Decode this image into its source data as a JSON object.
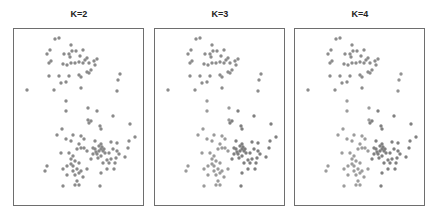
{
  "chart_data": [
    {
      "type": "scatter",
      "title": "K=2",
      "xlabel": "",
      "ylabel": "",
      "grid": false,
      "legend": null,
      "clusters": 2,
      "point_color": "#8a8a8a",
      "cluster_colors": [
        "#8a8a8a",
        "#8a8a8a"
      ]
    },
    {
      "type": "scatter",
      "title": "K=3",
      "xlabel": "",
      "ylabel": "",
      "grid": false,
      "legend": null,
      "clusters": 3,
      "cluster_colors": [
        "#8c8c8c",
        "#9a9a9a",
        "#7f7f7f"
      ]
    },
    {
      "type": "scatter",
      "title": "K=4",
      "xlabel": "",
      "ylabel": "",
      "grid": false,
      "legend": null,
      "clusters": 4,
      "cluster_colors": [
        "#8c8c8c",
        "#9c9c9c",
        "#808080",
        "#939393"
      ]
    }
  ],
  "points": [
    [
      54,
      38
    ],
    [
      58,
      37
    ],
    [
      70,
      44
    ],
    [
      46,
      53
    ],
    [
      49,
      49
    ],
    [
      63,
      53
    ],
    [
      68,
      53
    ],
    [
      71,
      50
    ],
    [
      69,
      56
    ],
    [
      75,
      50
    ],
    [
      82,
      49
    ],
    [
      79,
      55
    ],
    [
      86,
      57
    ],
    [
      84,
      59
    ],
    [
      88,
      62
    ],
    [
      93,
      60
    ],
    [
      96,
      58
    ],
    [
      50,
      60
    ],
    [
      48,
      62
    ],
    [
      62,
      63
    ],
    [
      66,
      64
    ],
    [
      70,
      62
    ],
    [
      74,
      62
    ],
    [
      78,
      61
    ],
    [
      82,
      62
    ],
    [
      94,
      64
    ],
    [
      88,
      72
    ],
    [
      90,
      69
    ],
    [
      86,
      71
    ],
    [
      48,
      75
    ],
    [
      58,
      75
    ],
    [
      68,
      75
    ],
    [
      78,
      74
    ],
    [
      80,
      76
    ],
    [
      60,
      82
    ],
    [
      65,
      81
    ],
    [
      26,
      89
    ],
    [
      53,
      89
    ],
    [
      80,
      87
    ],
    [
      119,
      73
    ],
    [
      117,
      79
    ],
    [
      116,
      90
    ],
    [
      65,
      100
    ],
    [
      65,
      110
    ],
    [
      87,
      107
    ],
    [
      96,
      110
    ],
    [
      112,
      115
    ],
    [
      87,
      119
    ],
    [
      90,
      120
    ],
    [
      88,
      122
    ],
    [
      99,
      125
    ],
    [
      100,
      128
    ],
    [
      129,
      123
    ],
    [
      61,
      128
    ],
    [
      56,
      134
    ],
    [
      72,
      134
    ],
    [
      80,
      135
    ],
    [
      83,
      138
    ],
    [
      65,
      138
    ],
    [
      70,
      140
    ],
    [
      78,
      143
    ],
    [
      94,
      140
    ],
    [
      100,
      143
    ],
    [
      110,
      141
    ],
    [
      116,
      142
    ],
    [
      128,
      140
    ],
    [
      134,
      136
    ],
    [
      127,
      147
    ],
    [
      60,
      152
    ],
    [
      68,
      152
    ],
    [
      70,
      158
    ],
    [
      72,
      155
    ],
    [
      76,
      148
    ],
    [
      80,
      147
    ],
    [
      83,
      147
    ],
    [
      86,
      150
    ],
    [
      94,
      148
    ],
    [
      98,
      145
    ],
    [
      100,
      148
    ],
    [
      102,
      150
    ],
    [
      104,
      152
    ],
    [
      100,
      155
    ],
    [
      96,
      153
    ],
    [
      108,
      152
    ],
    [
      112,
      148
    ],
    [
      116,
      150
    ],
    [
      118,
      153
    ],
    [
      124,
      156
    ],
    [
      115,
      157
    ],
    [
      110,
      158
    ],
    [
      106,
      159
    ],
    [
      92,
      153
    ],
    [
      90,
      158
    ],
    [
      74,
      160
    ],
    [
      72,
      165
    ],
    [
      70,
      163
    ],
    [
      66,
      165
    ],
    [
      78,
      162
    ],
    [
      102,
      162
    ],
    [
      108,
      162
    ],
    [
      114,
      162
    ],
    [
      46,
      165
    ],
    [
      44,
      170
    ],
    [
      62,
      168
    ],
    [
      72,
      170
    ],
    [
      76,
      168
    ],
    [
      80,
      170
    ],
    [
      86,
      168
    ],
    [
      100,
      172
    ],
    [
      106,
      168
    ],
    [
      113,
      168
    ],
    [
      66,
      174
    ],
    [
      74,
      174
    ],
    [
      78,
      172
    ],
    [
      82,
      176
    ],
    [
      76,
      180
    ],
    [
      78,
      184
    ],
    [
      62,
      185
    ],
    [
      74,
      184
    ],
    [
      99,
      185
    ],
    [
      92,
      147
    ],
    [
      98,
      150
    ],
    [
      101,
      146
    ],
    [
      97,
      157
    ],
    [
      103,
      148
    ],
    [
      95,
      151
    ]
  ],
  "panel_origins": [
    [
      13,
      28
    ],
    [
      154,
      28
    ],
    [
      294,
      28
    ]
  ]
}
